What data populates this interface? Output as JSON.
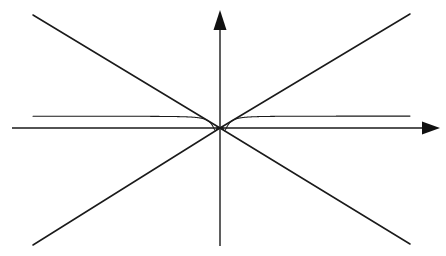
{
  "figure": {
    "title": "",
    "background_color": "#ffffff",
    "stroke_color": "#1a1a1a",
    "width": 446,
    "height": 256
  },
  "axes": {
    "x_axis": {
      "name": "x-axis",
      "label": "",
      "arrowhead": "right",
      "y_pixel": 128,
      "x_start_pixel": 12,
      "x_end_pixel": 440
    },
    "y_axis": {
      "name": "y-axis",
      "label": "",
      "arrowhead": "up",
      "x_pixel": 220,
      "y_top_pixel": 10,
      "y_bottom_pixel": 246
    },
    "origin_pixel": [
      220,
      128
    ],
    "ticks": [],
    "tick_labels": [],
    "grid": false
  },
  "chart_data": {
    "type": "line",
    "title": "",
    "subtitle": "",
    "xlabel": "",
    "ylabel": "",
    "xlim": [
      -1,
      1
    ],
    "ylim": [
      -1,
      1
    ],
    "grid": false,
    "legend": null,
    "legend_position": "none",
    "annotations": [],
    "series": [
      {
        "name": "oscillating-curve",
        "kind": "oscillation",
        "color": "#1a1a1a",
        "line_width": 1.05,
        "function": "y = x * sin(k / x)",
        "k": 0.1045,
        "x_domain": [
          -1,
          1
        ],
        "samples": 4000
      },
      {
        "name": "upper-envelope",
        "kind": "envelope",
        "color": "#1a1a1a",
        "line_width": 1.5,
        "function": "y = |x|",
        "points": [
          [
            -1,
            1
          ],
          [
            0,
            0
          ],
          [
            1,
            1
          ]
        ],
        "pixel_points": [
          [
            33,
            15
          ],
          [
            220,
            128
          ],
          [
            410,
            14
          ]
        ]
      },
      {
        "name": "lower-envelope",
        "kind": "envelope",
        "color": "#1a1a1a",
        "line_width": 1.5,
        "function": "y = -|x|",
        "points": [
          [
            -1,
            -1
          ],
          [
            0,
            0
          ],
          [
            1,
            -1
          ]
        ],
        "pixel_points": [
          [
            33,
            245
          ],
          [
            220,
            128
          ],
          [
            410,
            244
          ]
        ]
      }
    ],
    "peaks_left_of_origin": 4,
    "troughs_left_of_origin": 5,
    "peaks_right_of_origin": 5,
    "troughs_right_of_origin": 4
  }
}
